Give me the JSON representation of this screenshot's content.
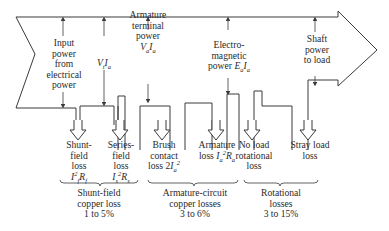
{
  "colors": {
    "stroke": "#3a3a3a",
    "text": "#2a2a2a",
    "background": "#ffffff"
  },
  "powers": {
    "input": [
      "Input",
      "power",
      "from",
      "electrical",
      "power"
    ],
    "vtia": "VtIa",
    "armature_terminal": [
      "Armature",
      "terminal",
      "power",
      "VaIa"
    ],
    "electromagnetic": [
      "Electro-",
      "magnetic",
      "power EaIa"
    ],
    "shaft": [
      "Shaft",
      "power",
      "to load"
    ]
  },
  "losses": [
    {
      "name": [
        "Shunt-",
        "field",
        "loss"
      ],
      "formula": "I²fRf"
    },
    {
      "name": [
        "Series-",
        "field",
        "loss"
      ],
      "formula": "Is²Rs"
    },
    {
      "name": [
        "Brush",
        "contact",
        "loss 2Ia²"
      ],
      "formula": ""
    },
    {
      "name": [
        "Armature",
        "loss Ia²Ra"
      ],
      "formula": ""
    },
    {
      "name": [
        "No load",
        "rotational",
        "loss"
      ],
      "formula": ""
    },
    {
      "name": [
        "Stray load",
        "loss"
      ],
      "formula": ""
    }
  ],
  "groups": [
    {
      "label": [
        "Shunt-field",
        "copper loss",
        "1 to 5%"
      ]
    },
    {
      "label": [
        "Armature-circuit",
        "copper losses",
        "3 to 6%"
      ]
    },
    {
      "label": [
        "Rotational",
        "losses",
        "3 to 15%"
      ]
    }
  ]
}
